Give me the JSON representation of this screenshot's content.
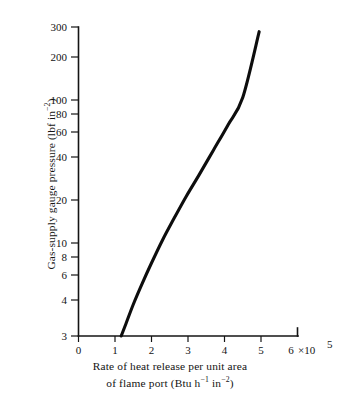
{
  "chart_data": {
    "type": "line",
    "title": "",
    "xlabel": "Rate of heat release per unit area of flame port (Btu h⁻¹ in⁻²)",
    "xlabel_line1": "Rate of heat release per unit area",
    "xlabel_line2_prefix": "of flame port (Btu h",
    "xlabel_line2_sup1": "−1",
    "xlabel_line2_mid": " in",
    "xlabel_line2_sup2": "−2",
    "xlabel_line2_suffix": ")",
    "ylabel": "Gas-supply gauge pressure (lbf in⁻²)",
    "ylabel_prefix": "Gas-supply gauge pressure (lbf in",
    "ylabel_sup": "−2",
    "ylabel_suffix": ")",
    "xscale": "linear",
    "yscale": "log",
    "xlim": [
      0,
      6
    ],
    "ylim": [
      3,
      300
    ],
    "x_unit_multiplier": "×10⁵",
    "grid": false,
    "legend": false,
    "x_ticks": [
      {
        "value": 0,
        "label": "0"
      },
      {
        "value": 1,
        "label": "1"
      },
      {
        "value": 2,
        "label": "2"
      },
      {
        "value": 3,
        "label": "3"
      },
      {
        "value": 4,
        "label": "4"
      },
      {
        "value": 5,
        "label": "5"
      },
      {
        "value": 6,
        "label": "6",
        "suffix_base": "×10",
        "suffix_exp": "5"
      }
    ],
    "y_ticks": [
      {
        "value": 300,
        "label": "300"
      },
      {
        "value": 200,
        "label": "200"
      },
      {
        "value": 100,
        "label": "100"
      },
      {
        "value": 80,
        "label": "80"
      },
      {
        "value": 60,
        "label": "60"
      },
      {
        "value": 40,
        "label": "40"
      },
      {
        "value": 20,
        "label": "20"
      },
      {
        "value": 10,
        "label": "10"
      },
      {
        "value": 8,
        "label": "8"
      },
      {
        "value": 6,
        "label": "6"
      },
      {
        "value": 4,
        "label": "4"
      },
      {
        "value": 3,
        "label": "3"
      }
    ],
    "series": [
      {
        "name": "gas-supply pressure vs heat release rate",
        "color": "#0d0d0d",
        "x": [
          1.17,
          1.3,
          1.5,
          1.75,
          2.0,
          2.3,
          2.6,
          2.95,
          3.3,
          3.7,
          4.1,
          4.5,
          4.95
        ],
        "y": [
          3.0,
          3.6,
          4.8,
          6.6,
          8.9,
          12.5,
          17.0,
          24.0,
          33.0,
          48.0,
          70.0,
          105.0,
          280.0
        ]
      }
    ]
  },
  "figure": {
    "background_color": "#ffffff",
    "axis_color": "#141414",
    "curve_color": "#0d0d0d"
  }
}
